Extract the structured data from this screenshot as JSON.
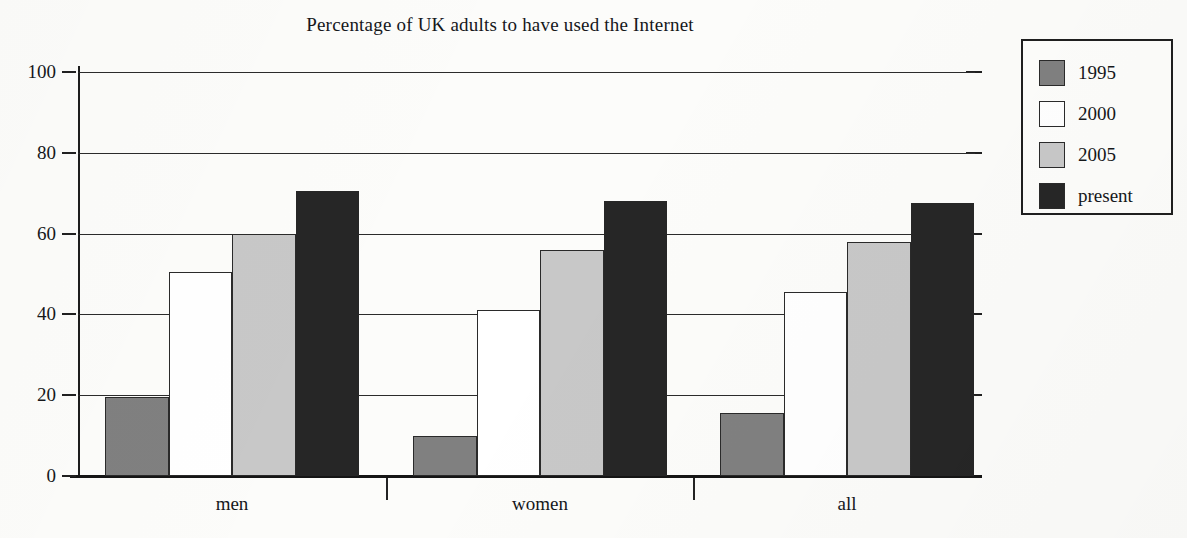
{
  "chart_data": {
    "type": "bar",
    "title": "Percentage of UK adults to have used the Internet",
    "xlabel": "",
    "ylabel": "",
    "ylim": [
      0,
      100
    ],
    "yticks": [
      0,
      20,
      40,
      60,
      80,
      100
    ],
    "grid": true,
    "legend_position": "right-outside",
    "categories": [
      "men",
      "women",
      "all"
    ],
    "series": [
      {
        "name": "1995",
        "color": "#808080",
        "values": [
          19.5,
          10.0,
          15.5
        ]
      },
      {
        "name": "2000",
        "color": "#ffffff",
        "values": [
          50.5,
          41.0,
          45.5
        ]
      },
      {
        "name": "2005",
        "color": "#c8c8c8",
        "values": [
          60.0,
          56.0,
          58.0
        ]
      },
      {
        "name": "present",
        "color": "#262626",
        "values": [
          70.5,
          68.0,
          67.5
        ]
      }
    ]
  },
  "axis": {
    "y_tick_labels": [
      "100",
      "80",
      "60",
      "40",
      "20",
      "0"
    ],
    "category_labels": [
      "men",
      "women",
      "all"
    ]
  },
  "legend": {
    "items": [
      {
        "label": "1995"
      },
      {
        "label": "2000"
      },
      {
        "label": "2005"
      },
      {
        "label": "present"
      }
    ]
  }
}
